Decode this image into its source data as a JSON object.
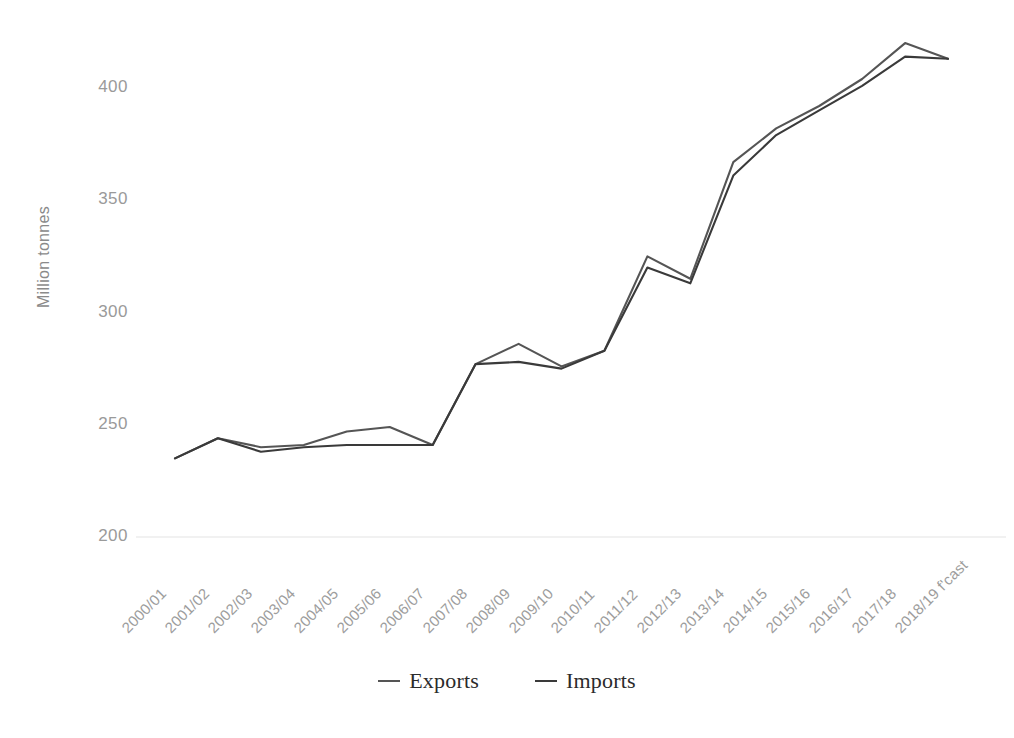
{
  "chart_data": {
    "type": "line",
    "title": "",
    "xlabel": "",
    "ylabel": "Million tonnes",
    "ylim": [
      200,
      420
    ],
    "yticks": [
      200,
      250,
      300,
      350,
      400
    ],
    "grid": false,
    "legend_position": "bottom",
    "categories": [
      "2000/01",
      "2001/02",
      "2002/03",
      "2003/04",
      "2004/05",
      "2005/06",
      "2006/07",
      "2007/08",
      "2008/09",
      "2009/10",
      "2010/11",
      "2011/12",
      "2012/13",
      "2013/14",
      "2014/15",
      "2015/16",
      "2016/17",
      "2017/18",
      "2018/19 f'cast"
    ],
    "series": [
      {
        "name": "Exports",
        "color": "#555555",
        "values": [
          235,
          244,
          240,
          241,
          247,
          249,
          241,
          277,
          286,
          276,
          283,
          325,
          315,
          367,
          382,
          392,
          404,
          420,
          413
        ]
      },
      {
        "name": "Imports",
        "color": "#3a3a3a",
        "values": [
          235,
          244,
          238,
          240,
          241,
          241,
          241,
          277,
          278,
          275,
          283,
          320,
          313,
          361,
          379,
          390,
          401,
          414,
          413
        ]
      }
    ]
  },
  "legend": {
    "entries": [
      {
        "label": "Exports"
      },
      {
        "label": "Imports"
      }
    ]
  },
  "axes": {
    "y_title": "Million tonnes",
    "y_tick_labels": [
      "400",
      "350",
      "300",
      "250",
      "200"
    ],
    "x_tick_labels": [
      "2000/01",
      "2001/02",
      "2002/03",
      "2003/04",
      "2004/05",
      "2005/06",
      "2006/07",
      "2007/08",
      "2008/09",
      "2009/10",
      "2010/11",
      "2011/12",
      "2012/13",
      "2013/14",
      "2014/15",
      "2015/16",
      "2016/17",
      "2017/18",
      "2018/19 f'cast"
    ]
  },
  "colors": {
    "exports_line": "#555555",
    "imports_line": "#3a3a3a",
    "tick_text": "#9a9a9a",
    "axis_title": "#8a8a8a",
    "legend_text": "#2b2b2b",
    "gridline": "#ededed",
    "background": "#ffffff"
  }
}
